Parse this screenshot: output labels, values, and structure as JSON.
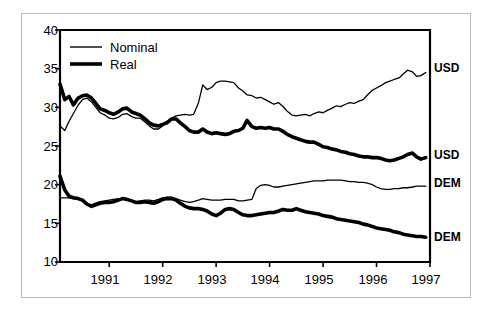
{
  "chart_data": {
    "type": "line",
    "title": "",
    "subtitle": "",
    "xlabel": "",
    "ylabel": "",
    "xlim": [
      1990.08,
      1997.0
    ],
    "ylim": [
      10,
      40
    ],
    "grid": false,
    "legend_position": "top-left",
    "y_ticks": [
      10,
      15,
      20,
      25,
      30,
      35,
      40
    ],
    "y_tick_labels": [
      "10",
      "15",
      "20",
      "25",
      "30",
      "35",
      "40"
    ],
    "x_ticks": [
      1991,
      1992,
      1993,
      1994,
      1995,
      1996,
      1997
    ],
    "x_tick_labels": [
      "1991",
      "1992",
      "1993",
      "1994",
      "1995",
      "1996",
      "1997"
    ],
    "legend": [
      {
        "name": "Nominal",
        "style": "thin-line"
      },
      {
        "name": "Real",
        "style": "thick-line"
      }
    ],
    "series_end_labels": [
      {
        "text": "USD",
        "series": "usd_nominal",
        "value_at_end": 34.5
      },
      {
        "text": "USD",
        "series": "usd_real",
        "value_at_end": 23.5
      },
      {
        "text": "DEM",
        "series": "dem_nominal",
        "value_at_end": 19.8
      },
      {
        "text": "DEM",
        "series": "dem_real",
        "value_at_end": 13.2
      }
    ],
    "x": [
      1990.08,
      1990.17,
      1990.25,
      1990.33,
      1990.42,
      1990.5,
      1990.58,
      1990.67,
      1990.75,
      1990.83,
      1990.92,
      1991.0,
      1991.08,
      1991.17,
      1991.25,
      1991.33,
      1991.42,
      1991.5,
      1991.58,
      1991.67,
      1991.75,
      1991.83,
      1991.92,
      1992.0,
      1992.08,
      1992.17,
      1992.25,
      1992.33,
      1992.42,
      1992.5,
      1992.58,
      1992.67,
      1992.75,
      1992.83,
      1992.92,
      1993.0,
      1993.08,
      1993.17,
      1993.25,
      1993.33,
      1993.42,
      1993.5,
      1993.58,
      1993.67,
      1993.75,
      1993.83,
      1993.92,
      1994.0,
      1994.08,
      1994.17,
      1994.25,
      1994.33,
      1994.42,
      1994.5,
      1994.58,
      1994.67,
      1994.75,
      1994.83,
      1994.92,
      1995.0,
      1995.08,
      1995.17,
      1995.25,
      1995.33,
      1995.42,
      1995.5,
      1995.58,
      1995.67,
      1995.75,
      1995.83,
      1995.92,
      1996.0,
      1996.08,
      1996.17,
      1996.25,
      1996.33,
      1996.42,
      1996.5,
      1996.58,
      1996.67,
      1996.75,
      1996.83,
      1996.92
    ],
    "series": [
      {
        "name": "USD Nominal",
        "key": "usd_nominal",
        "style": "thin",
        "end_label": "USD",
        "values": [
          27.6,
          27.0,
          28.2,
          29.2,
          30.3,
          31.0,
          31.2,
          30.7,
          30.0,
          29.3,
          29.0,
          28.6,
          28.5,
          28.7,
          29.1,
          29.2,
          28.8,
          28.6,
          28.6,
          28.1,
          27.6,
          27.2,
          27.2,
          27.6,
          28.2,
          28.6,
          28.9,
          29.0,
          29.1,
          29.0,
          29.1,
          30.6,
          32.9,
          32.3,
          32.6,
          33.2,
          33.4,
          33.4,
          33.3,
          33.2,
          32.5,
          32.1,
          31.6,
          31.5,
          31.2,
          31.3,
          31.0,
          30.7,
          30.4,
          30.6,
          30.1,
          29.5,
          29.0,
          28.9,
          29.0,
          29.1,
          28.9,
          29.2,
          29.4,
          29.3,
          29.6,
          29.9,
          30.2,
          30.1,
          30.4,
          30.6,
          30.5,
          30.8,
          31.0,
          31.6,
          32.2,
          32.5,
          32.8,
          33.2,
          33.4,
          33.6,
          33.8,
          34.3,
          34.8,
          34.6,
          34.0,
          34.1,
          34.5
        ]
      },
      {
        "name": "USD Real",
        "key": "usd_real",
        "style": "thick",
        "end_label": "USD",
        "values": [
          33.0,
          31.0,
          31.4,
          30.3,
          31.2,
          31.5,
          31.6,
          31.2,
          30.5,
          29.8,
          29.6,
          29.3,
          29.1,
          29.4,
          29.8,
          29.9,
          29.4,
          29.2,
          29.0,
          28.5,
          28.0,
          27.7,
          27.6,
          27.8,
          28.0,
          28.5,
          28.5,
          28.0,
          27.5,
          27.0,
          26.8,
          26.8,
          27.2,
          26.8,
          26.6,
          26.7,
          26.6,
          26.5,
          26.6,
          26.9,
          27.0,
          27.3,
          28.3,
          27.5,
          27.3,
          27.4,
          27.3,
          27.4,
          27.2,
          27.2,
          26.9,
          26.5,
          26.2,
          26.0,
          25.8,
          25.6,
          25.5,
          25.5,
          25.2,
          24.9,
          24.8,
          24.6,
          24.5,
          24.3,
          24.2,
          24.0,
          23.9,
          23.7,
          23.6,
          23.6,
          23.5,
          23.5,
          23.4,
          23.2,
          23.1,
          23.2,
          23.4,
          23.6,
          23.9,
          24.1,
          23.6,
          23.3,
          23.5
        ]
      },
      {
        "name": "DEM Nominal",
        "key": "dem_nominal",
        "style": "thin",
        "end_label": "DEM",
        "values": [
          18.3,
          18.3,
          18.3,
          18.2,
          18.1,
          17.9,
          17.6,
          17.4,
          17.6,
          17.8,
          17.9,
          18.0,
          18.1,
          18.2,
          18.2,
          18.1,
          17.9,
          17.8,
          17.9,
          18.0,
          18.0,
          17.9,
          18.1,
          18.3,
          18.4,
          18.4,
          18.2,
          18.0,
          17.8,
          17.7,
          17.8,
          18.0,
          18.2,
          18.1,
          18.0,
          18.0,
          18.0,
          18.1,
          18.1,
          18.1,
          17.9,
          17.9,
          18.0,
          18.1,
          19.5,
          19.9,
          20.0,
          19.9,
          19.7,
          19.7,
          19.8,
          19.9,
          20.0,
          20.1,
          20.2,
          20.3,
          20.4,
          20.5,
          20.5,
          20.5,
          20.6,
          20.6,
          20.6,
          20.6,
          20.5,
          20.4,
          20.4,
          20.3,
          20.3,
          20.2,
          20.0,
          19.7,
          19.5,
          19.4,
          19.4,
          19.5,
          19.5,
          19.6,
          19.6,
          19.7,
          19.8,
          19.8,
          19.8
        ]
      },
      {
        "name": "DEM Real",
        "key": "dem_real",
        "style": "thick",
        "end_label": "DEM",
        "values": [
          21.1,
          19.3,
          18.5,
          18.3,
          18.2,
          18.0,
          17.5,
          17.2,
          17.4,
          17.6,
          17.7,
          17.7,
          17.8,
          18.0,
          18.2,
          18.1,
          17.9,
          17.7,
          17.7,
          17.8,
          17.7,
          17.6,
          17.8,
          18.1,
          18.2,
          18.2,
          18.0,
          17.6,
          17.2,
          17.0,
          16.9,
          16.9,
          16.8,
          16.6,
          16.2,
          16.0,
          16.3,
          16.8,
          16.9,
          16.8,
          16.4,
          16.1,
          16.0,
          16.0,
          16.1,
          16.2,
          16.3,
          16.4,
          16.4,
          16.6,
          16.8,
          16.7,
          16.7,
          16.9,
          16.7,
          16.5,
          16.4,
          16.3,
          16.2,
          16.0,
          15.9,
          15.8,
          15.6,
          15.5,
          15.4,
          15.3,
          15.2,
          15.1,
          14.9,
          14.8,
          14.6,
          14.4,
          14.3,
          14.2,
          14.1,
          13.9,
          13.8,
          13.6,
          13.5,
          13.4,
          13.3,
          13.3,
          13.2
        ]
      }
    ]
  }
}
